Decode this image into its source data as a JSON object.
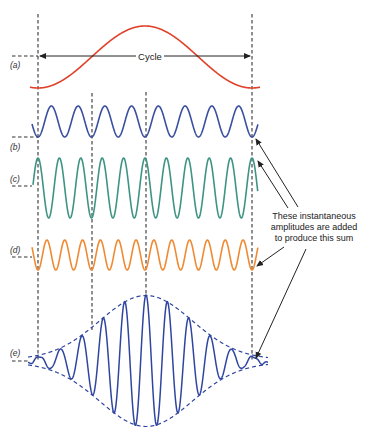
{
  "figure": {
    "cycle_label": "Cycle",
    "panel_labels": [
      "(a)",
      "(b)",
      "(c)",
      "(d)",
      "(e)"
    ],
    "annotation_lines": [
      "These instantaneous",
      "amplitudes are added",
      "to produce this sum"
    ],
    "colors": {
      "a": "#e0412a",
      "b": "#3a4fa0",
      "c": "#3e9484",
      "d": "#ef8a32",
      "e": "#2f45a0",
      "guides": "#333333"
    }
  },
  "chart_data": {
    "type": "line",
    "xlabel": "",
    "ylabel": "",
    "series": [
      {
        "name": "(a)",
        "description": "Envelope reference sinusoid",
        "cycles": 1,
        "phase_at_start": "trough"
      },
      {
        "name": "(b)",
        "description": "Component sinusoid",
        "cycles": 8,
        "phase_at_start": "trough"
      },
      {
        "name": "(c)",
        "description": "Component sinusoid (larger amplitude)",
        "cycles": 10,
        "phase_at_start": "peak"
      },
      {
        "name": "(d)",
        "description": "Component sinusoid",
        "cycles": 12,
        "phase_at_start": "trough"
      },
      {
        "name": "(e)",
        "description": "Sum of (b)+(c)+(d): wave packet with dashed envelope",
        "peak_at": "center of cycle"
      }
    ],
    "annotations": [
      "Cycle",
      "These instantaneous amplitudes are added to produce this sum"
    ]
  }
}
